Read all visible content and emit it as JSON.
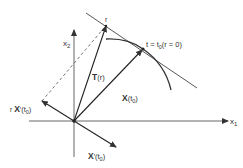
{
  "diagram": {
    "axes": {
      "x1_label_base": "x",
      "x1_label_sub": "1",
      "x2_label_base": "x",
      "x2_label_sub": "2"
    },
    "labels": {
      "point_r": "r",
      "point_t0": "t = t",
      "point_t0_sub": "0",
      "point_t0_paren": "(r = 0)",
      "T_vec": "T",
      "T_arg": "(r)",
      "X_vec": "X",
      "X_arg_open": "(t",
      "X_arg_sub": "0",
      "X_arg_close": ")",
      "rXp_prefix": "r",
      "rXp_vec": "X",
      "rXp_prime": "′",
      "rXp_arg_open": "(t",
      "rXp_arg_sub": "0",
      "rXp_arg_close": ")",
      "Xp_vec": "X",
      "Xp_prime": "′",
      "Xp_arg_open": "(t",
      "Xp_arg_sub": "0",
      "Xp_arg_close": ")"
    },
    "colors": {
      "line": "#333333",
      "background": "#ffffff"
    }
  }
}
